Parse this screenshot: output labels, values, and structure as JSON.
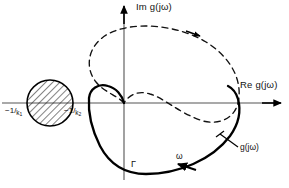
{
  "figure": {
    "type": "nyquist-plot",
    "title_present": false,
    "background_color": "#ffffff",
    "stroke_color": "#000000",
    "axis_color": "#444444",
    "width": 289,
    "height": 188
  },
  "axes": {
    "imaginary": {
      "label": "Im g(jω)",
      "orientation": "vertical",
      "arrow": "up",
      "x": 124,
      "y_top": 8,
      "y_bottom": 180
    },
    "real": {
      "label": "Re g(jω)",
      "orientation": "horizontal",
      "arrow": "right",
      "y": 103,
      "x_left": 2,
      "x_right": 283
    },
    "origin": {
      "x": 124,
      "y": 103
    }
  },
  "markers": {
    "hatched_disk": {
      "name": "uncertainty-disk",
      "center_x": 50,
      "center_y": 103,
      "radius": 23,
      "fill": "hatched",
      "hatch_angle_deg": 45
    },
    "critical_points": [
      {
        "label_num": "−1",
        "label_den": "k",
        "label_sub": "1",
        "x": 14,
        "y": 107
      },
      {
        "label_num": "−1",
        "label_den": "k",
        "label_sub": "2",
        "x": 73,
        "y": 107
      }
    ]
  },
  "curves": [
    {
      "name": "nyquist-locus",
      "style": "solid",
      "label": "g(jω)",
      "contour_label": "Γ",
      "direction_label": "ω",
      "direction": "clockwise",
      "real_axis_crossing_x": 238,
      "loop_leftmost_x": 88,
      "lobe_bottom_y": 172
    },
    {
      "name": "uncertainty-locus",
      "style": "dashed",
      "direction": "clockwise",
      "top_y": 28,
      "right_x": 238,
      "left_x": 88
    }
  ],
  "labels": {
    "im_axis": "Im g(jω)",
    "re_axis": "Re g(jω)",
    "k1": {
      "num": "−1",
      "den": "k",
      "sub": "1"
    },
    "k2": {
      "num": "−1",
      "den": "k",
      "sub": "2"
    },
    "gamma": "Γ",
    "omega": "ω",
    "gjw": "g(jω)"
  }
}
